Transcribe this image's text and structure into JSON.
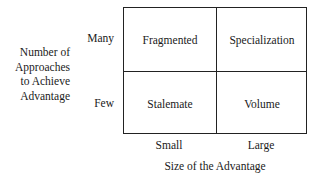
{
  "y_axis": {
    "label_lines": [
      "Number of",
      "Approaches",
      "to Achieve",
      "Advantage"
    ],
    "rows": [
      "Many",
      "Few"
    ]
  },
  "x_axis": {
    "label": "Size of the Advantage",
    "columns": [
      "Small",
      "Large"
    ]
  },
  "cells": {
    "many_small": "Fragmented",
    "many_large": "Specialization",
    "few_small": "Stalemate",
    "few_large": "Volume"
  }
}
